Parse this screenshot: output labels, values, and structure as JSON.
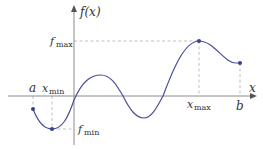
{
  "diagram": {
    "labels": {
      "y_axis": "f(x)",
      "x_axis": "x",
      "a": "a",
      "b": "b",
      "x_min": "x",
      "x_min_sub": "min",
      "x_max": "x",
      "x_max_sub": "max",
      "f_max": "f",
      "f_max_sub": "max",
      "f_min": "f",
      "f_min_sub": "min"
    },
    "colors": {
      "curve": "#4a4f9a",
      "axis": "#888888",
      "guide": "#aaaaaa",
      "point": "#3a3f8a",
      "text": "#333333"
    },
    "points": {
      "a": [
        33,
        109
      ],
      "min": [
        52,
        129
      ],
      "local_max": [
        101,
        75
      ],
      "local_min": [
        144,
        118
      ],
      "max": [
        199,
        41
      ],
      "b": [
        240,
        63
      ]
    }
  }
}
